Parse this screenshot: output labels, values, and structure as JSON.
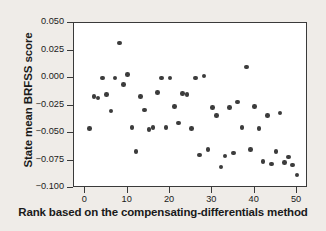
{
  "chart_data": {
    "type": "scatter",
    "title": "",
    "xlabel": "Rank based on the compensating-differentials method",
    "ylabel": "State mean BRFSS score",
    "xlim": [
      -2.7,
      52.6
    ],
    "ylim": [
      -0.1,
      0.05
    ],
    "xticks": [
      0,
      10,
      20,
      30,
      40,
      50
    ],
    "xtick_labels": [
      "0",
      "10",
      "20",
      "30",
      "40",
      "50"
    ],
    "yticks": [
      0.05,
      0.025,
      0.0,
      -0.025,
      -0.05,
      -0.075,
      -0.1
    ],
    "ytick_labels": [
      "0.050",
      "0.025",
      "0.000",
      "-0.025",
      "-0.050",
      "-0.075",
      "-0.100"
    ],
    "grid": false,
    "legend": null,
    "marker": "filled-circle",
    "marker_color": "#3c3c3c",
    "plot_background": "#ffffff",
    "figure_background": "#efece8",
    "points": [
      {
        "x": 1,
        "y": -0.046
      },
      {
        "x": 2,
        "y": -0.017
      },
      {
        "x": 3,
        "y": -0.018
      },
      {
        "x": 4,
        "y": 0.0
      },
      {
        "x": 5,
        "y": -0.015
      },
      {
        "x": 6,
        "y": -0.03
      },
      {
        "x": 7,
        "y": 0.0
      },
      {
        "x": 8,
        "y": 0.032
      },
      {
        "x": 9,
        "y": -0.006
      },
      {
        "x": 10,
        "y": 0.003
      },
      {
        "x": 11,
        "y": -0.045
      },
      {
        "x": 12,
        "y": -0.067
      },
      {
        "x": 13,
        "y": -0.017
      },
      {
        "x": 14,
        "y": -0.029
      },
      {
        "x": 15,
        "y": -0.047
      },
      {
        "x": 16,
        "y": -0.045
      },
      {
        "x": 17,
        "y": -0.013
      },
      {
        "x": 18,
        "y": 0.0
      },
      {
        "x": 19,
        "y": -0.045
      },
      {
        "x": 20,
        "y": 0.0
      },
      {
        "x": 21,
        "y": -0.026
      },
      {
        "x": 22,
        "y": -0.041
      },
      {
        "x": 23,
        "y": -0.014
      },
      {
        "x": 24,
        "y": -0.015
      },
      {
        "x": 25,
        "y": -0.046
      },
      {
        "x": 26,
        "y": 0.0
      },
      {
        "x": 27,
        "y": -0.07
      },
      {
        "x": 28,
        "y": 0.002
      },
      {
        "x": 29,
        "y": -0.065
      },
      {
        "x": 30,
        "y": -0.027
      },
      {
        "x": 31,
        "y": -0.034
      },
      {
        "x": 32,
        "y": -0.081
      },
      {
        "x": 33,
        "y": -0.071
      },
      {
        "x": 34,
        "y": -0.027
      },
      {
        "x": 35,
        "y": -0.068
      },
      {
        "x": 36,
        "y": -0.022
      },
      {
        "x": 37,
        "y": -0.045
      },
      {
        "x": 38,
        "y": 0.01
      },
      {
        "x": 39,
        "y": -0.065
      },
      {
        "x": 40,
        "y": -0.026
      },
      {
        "x": 41,
        "y": -0.046
      },
      {
        "x": 42,
        "y": -0.076
      },
      {
        "x": 43,
        "y": -0.034
      },
      {
        "x": 44,
        "y": -0.078
      },
      {
        "x": 45,
        "y": -0.067
      },
      {
        "x": 46,
        "y": -0.032
      },
      {
        "x": 47,
        "y": -0.077
      },
      {
        "x": 48,
        "y": -0.072
      },
      {
        "x": 49,
        "y": -0.079
      },
      {
        "x": 50,
        "y": -0.088
      }
    ]
  }
}
